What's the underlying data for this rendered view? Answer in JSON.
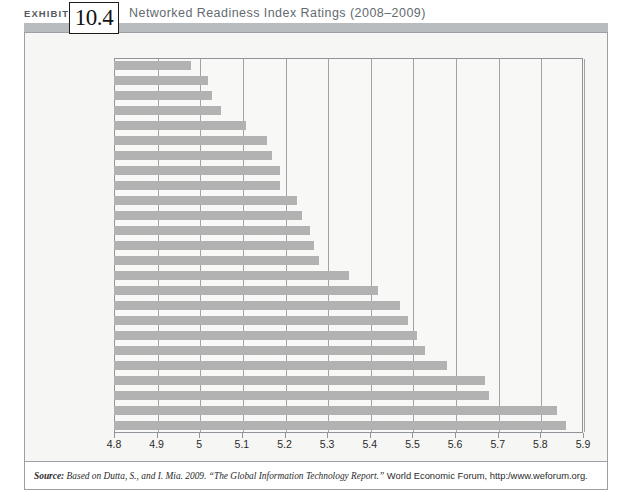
{
  "header": {
    "exhibit_label": "EXHIBIT",
    "exhibit_number": "10.4",
    "title": "Networked Readiness Index Ratings (2008–2009)"
  },
  "source": {
    "lead": "Source:",
    "italic_part": " Based on Dutta, S., and I. Mia. 2009. “The Global Information Technology Report.”",
    "roman_part": " World Economic Forum, http:/www.weforum.org.",
    "full": "Source: Based on Dutta, S., and I. Mia. 2009. “The Global Information Technology Report.” World Economic Forum, http:/www.weforum.org."
  },
  "colors": {
    "bar": "#b2b2b2",
    "plot_background": "#f8f8f6",
    "frame_background": "#f6f6f4",
    "gridline": "#9ea3a6",
    "border": "#9aa0a4",
    "header_band": "#b9bcbe",
    "title_text": "#636a70"
  },
  "chart_data": {
    "type": "bar",
    "orientation": "horizontal",
    "title": "Networked Readiness Index Ratings (2008–2009)",
    "xlabel": "",
    "ylabel": "",
    "xlim": [
      4.8,
      5.9
    ],
    "xticks": [
      "4.8",
      "4.9",
      "5",
      "5.1",
      "5.2",
      "5.3",
      "5.4",
      "5.5",
      "5.6",
      "5.7",
      "5.8",
      "5.9"
    ],
    "grid": true,
    "legend": null,
    "categories": [
      "Israel",
      "Belgium",
      "Ireland",
      "New Zealand",
      "Luxembourg",
      "Germany",
      "France",
      "Estonia",
      "Japan",
      "Austria",
      "U.K.",
      "Australia",
      "Taiwan",
      "Hong Kong",
      "S. Korea",
      "Cananda",
      "Netherlands",
      "Norway",
      "Iceland",
      "Finland",
      "Switzerland",
      "Singapore",
      "United States",
      "Sweden",
      "Denmark"
    ],
    "values": [
      4.98,
      5.02,
      5.03,
      5.05,
      5.11,
      5.16,
      5.17,
      5.19,
      5.19,
      5.23,
      5.24,
      5.26,
      5.27,
      5.28,
      5.35,
      5.42,
      5.47,
      5.49,
      5.51,
      5.53,
      5.58,
      5.67,
      5.68,
      5.84,
      5.86
    ]
  }
}
